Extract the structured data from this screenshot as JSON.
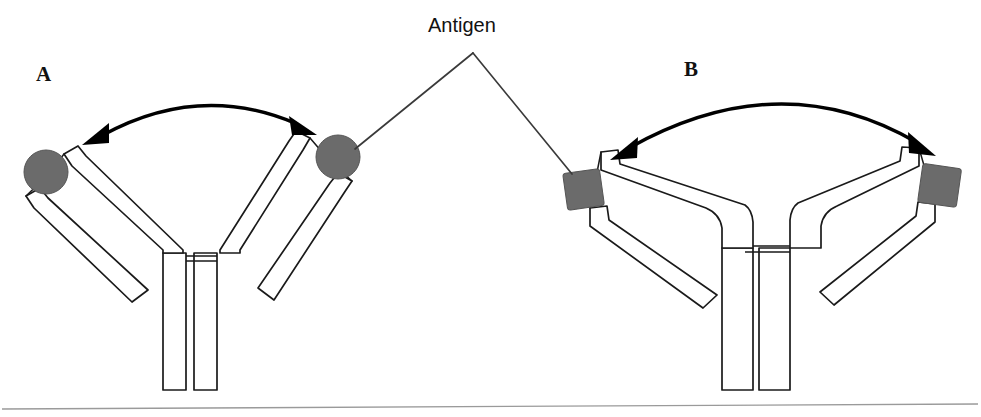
{
  "figure": {
    "background_color": "#ffffff",
    "width": 981,
    "height": 417
  },
  "labels": {
    "panel_a": "A",
    "panel_b": "B",
    "antigen": "Antigen"
  },
  "colors": {
    "antigen_fill": "#6b6b6b",
    "antigen_stroke": "#555555",
    "outline": "#1a1a1a",
    "arrow": "#000000",
    "leader": "#3a3a3a",
    "baseline": "#9a9a9a",
    "paper": "#ffffff"
  },
  "panels": [
    {
      "id": "a",
      "label": "A",
      "antigen_shape": "circle",
      "antigen_count": 2,
      "arm_configuration": "narrow-y-steep-arms",
      "arrow_type": "double-headed-curved-arrow",
      "arrow_span_px": 240,
      "antigens": [
        {
          "shape": "circle",
          "cx": 46,
          "cy": 172,
          "r": 22
        },
        {
          "shape": "circle",
          "cx": 338,
          "cy": 157,
          "r": 22
        }
      ]
    },
    {
      "id": "b",
      "label": "B",
      "antigen_shape": "square",
      "antigen_count": 2,
      "arm_configuration": "wide-y-horizontal-arms",
      "arrow_type": "double-headed-curved-arrow",
      "arrow_span_px": 300,
      "antigens": [
        {
          "shape": "square",
          "cx": 583,
          "cy": 189,
          "size": 37,
          "rotation_deg": -8
        },
        {
          "shape": "square",
          "cx": 940,
          "cy": 186,
          "size": 39,
          "rotation_deg": 8
        }
      ]
    }
  ],
  "annotations": {
    "leader_lines": [
      {
        "from": "antigen-label",
        "to": "panel-a-right-antigen"
      },
      {
        "from": "antigen-label",
        "to": "panel-b-left-antigen"
      }
    ],
    "baseline_rule": true
  }
}
